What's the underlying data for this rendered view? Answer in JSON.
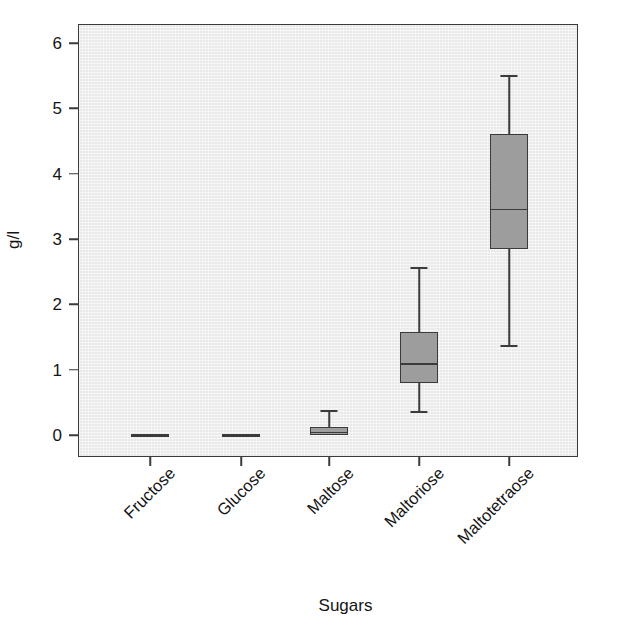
{
  "chart_data": {
    "type": "box",
    "title": "",
    "xlabel": "Sugars",
    "ylabel": "g/l",
    "ylim": [
      -0.35,
      6.4
    ],
    "yticks": [
      0,
      1,
      2,
      3,
      4,
      5,
      6
    ],
    "ytick_labels": [
      "0",
      "1",
      "2",
      "3",
      "4",
      "5",
      "6"
    ],
    "grid": false,
    "legend": "none",
    "categories": [
      "Fructose",
      "Glucose",
      "Maltose",
      "Maltoriose",
      "Maltotetraose"
    ],
    "boxes": [
      {
        "category": "Fructose",
        "whisker_low": 0.0,
        "q1": 0.0,
        "median": 0.0,
        "q3": 0.0,
        "whisker_high": 0.0,
        "degenerate": true
      },
      {
        "category": "Glucose",
        "whisker_low": 0.0,
        "q1": 0.0,
        "median": 0.0,
        "q3": 0.0,
        "whisker_high": 0.0,
        "degenerate": true
      },
      {
        "category": "Maltose",
        "whisker_low": 0.0,
        "q1": 0.0,
        "median": 0.05,
        "q3": 0.12,
        "whisker_high": 0.38,
        "degenerate": false
      },
      {
        "category": "Maltoriose",
        "whisker_low": 0.33,
        "q1": 0.79,
        "median": 1.1,
        "q3": 1.57,
        "whisker_high": 2.57,
        "degenerate": false
      },
      {
        "category": "Maltotetraose",
        "whisker_low": 1.35,
        "q1": 2.85,
        "median": 3.46,
        "q3": 4.61,
        "whisker_high": 5.51,
        "degenerate": false
      }
    ],
    "colors": {
      "panel_background": "#e9e9e9",
      "box_fill": "#9d9d9d",
      "line": "#3b3b3b",
      "text": "#141414",
      "figure_background": "#ffffff"
    }
  }
}
